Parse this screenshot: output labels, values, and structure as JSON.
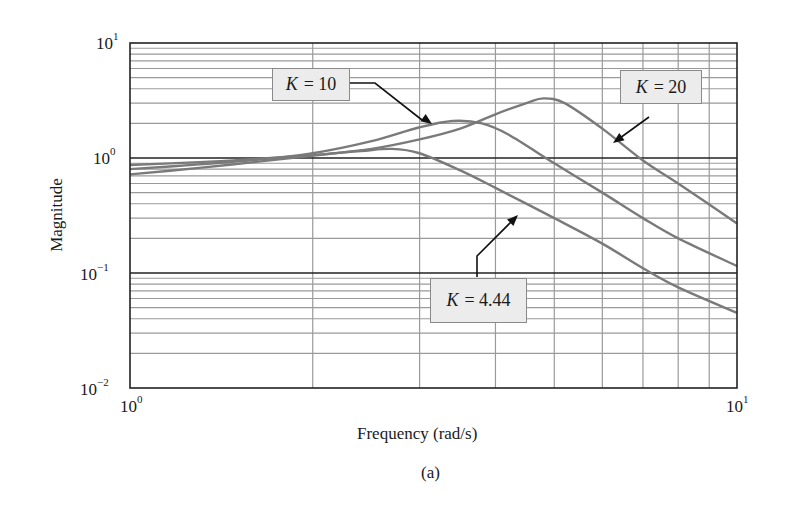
{
  "chart_data": {
    "type": "line",
    "title": "",
    "subtitle": "(a)",
    "xlabel": "Frequency (rad/s)",
    "ylabel": "Magnitude",
    "xscale": "log",
    "yscale": "log",
    "xlim": [
      1,
      10
    ],
    "ylim": [
      0.01,
      10
    ],
    "x_ticks": [
      {
        "base": "10",
        "exp": "0"
      },
      {
        "base": "10",
        "exp": "1"
      }
    ],
    "y_ticks": [
      {
        "base": "10",
        "exp": "1"
      },
      {
        "base": "10",
        "exp": "0"
      },
      {
        "base": "10",
        "exp": "−1"
      },
      {
        "base": "10",
        "exp": "−2"
      }
    ],
    "grid": true,
    "legend": "annotations",
    "series": [
      {
        "name": "K = 4.44",
        "k_symbol": "K",
        "k_value": "= 4.44",
        "x": [
          1.0,
          1.3,
          1.6,
          2.0,
          2.4,
          2.7,
          3.0,
          3.5,
          4.0,
          5.0,
          6.0,
          7.0,
          8.0,
          10.0
        ],
        "y": [
          0.87,
          0.92,
          0.98,
          1.06,
          1.15,
          1.2,
          1.1,
          0.78,
          0.55,
          0.3,
          0.18,
          0.11,
          0.075,
          0.045
        ]
      },
      {
        "name": "K = 10",
        "k_symbol": "K",
        "k_value": "= 10",
        "x": [
          1.0,
          1.3,
          1.6,
          2.0,
          2.5,
          3.0,
          3.4,
          3.8,
          4.2,
          5.0,
          6.0,
          7.0,
          8.0,
          10.0
        ],
        "y": [
          0.8,
          0.88,
          0.96,
          1.1,
          1.4,
          1.85,
          2.1,
          2.0,
          1.6,
          0.9,
          0.5,
          0.3,
          0.2,
          0.115
        ]
      },
      {
        "name": "K = 20",
        "k_symbol": "K",
        "k_value": "= 20",
        "x": [
          1.0,
          1.3,
          1.6,
          2.0,
          2.5,
          3.0,
          3.5,
          4.0,
          4.5,
          4.8,
          5.2,
          6.0,
          7.0,
          8.0,
          10.0
        ],
        "y": [
          0.72,
          0.82,
          0.92,
          1.05,
          1.2,
          1.45,
          1.8,
          2.4,
          3.0,
          3.3,
          3.0,
          1.8,
          0.95,
          0.6,
          0.27
        ]
      }
    ],
    "annotations": [
      {
        "series": "K = 10",
        "label_box": [
          272,
          68,
          350,
          100
        ],
        "arrow_to": [
          432,
          124
        ]
      },
      {
        "series": "K = 20",
        "label_box": [
          620,
          70,
          701,
          103
        ],
        "arrow_to": [
          613,
          143
        ]
      },
      {
        "series": "K = 4.44",
        "label_box": [
          430,
          277,
          526,
          322
        ],
        "arrow_to": [
          518,
          215
        ]
      }
    ]
  },
  "colors": {
    "curve": "#7a7a7a",
    "grid_minor": "#9a9a9a",
    "grid_major": "#222222",
    "box_bg": "#ececec",
    "box_border": "#8a8a8a"
  }
}
